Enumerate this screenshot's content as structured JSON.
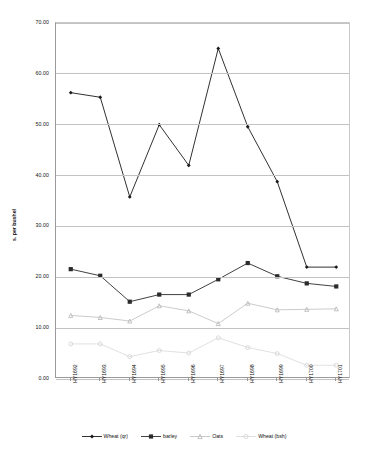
{
  "chart_data": {
    "type": "line",
    "title": "",
    "xlabel": "",
    "ylabel": "s. per bushel",
    "ylim": [
      0,
      70
    ],
    "ytick_step": 10,
    "grid": true,
    "legend_position": "bottom",
    "categories": [
      "HY1692",
      "HY1693",
      "HY1694",
      "HY1695",
      "HY1696",
      "HY1697",
      "HY1698",
      "HY1699",
      "HY1700",
      "HY1701"
    ],
    "series": [
      {
        "name": "Wheat (qr)",
        "color": "#1a1a1a",
        "marker": "diamond",
        "values": [
          56.3,
          55.4,
          35.8,
          50.0,
          42.0,
          65.0,
          49.6,
          38.8,
          22.0,
          22.0
        ]
      },
      {
        "name": "barley",
        "color": "#2b2b2b",
        "marker": "square",
        "values": [
          21.6,
          20.3,
          15.2,
          16.6,
          16.6,
          19.6,
          22.8,
          20.2,
          18.8,
          18.2
        ]
      },
      {
        "name": "Oats",
        "color": "#b4b4b4",
        "marker": "triangle",
        "values": [
          12.5,
          12.1,
          11.4,
          14.4,
          13.4,
          10.9,
          14.9,
          13.6,
          13.7,
          13.8
        ]
      },
      {
        "name": "Wheat (bsh)",
        "color": "#d2d2d2",
        "marker": "circle",
        "values": [
          6.9,
          6.9,
          4.4,
          5.6,
          5.1,
          8.1,
          6.2,
          5.0,
          2.7,
          2.7
        ]
      }
    ],
    "ytick_labels": [
      "0.00",
      "10.00",
      "20.00",
      "30.00",
      "40.00",
      "50.00",
      "60.00",
      "70.00"
    ]
  },
  "legend": {
    "items": [
      {
        "label": "Wheat (qr)"
      },
      {
        "label": "barley"
      },
      {
        "label": "Oats"
      },
      {
        "label": "Wheat (bsh)"
      }
    ]
  }
}
